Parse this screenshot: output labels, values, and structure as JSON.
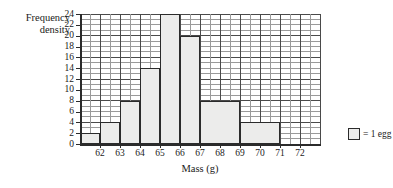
{
  "chart_data": {
    "type": "bar",
    "title": "",
    "xlabel": "Mass (g)",
    "ylabel_lines": [
      "Frequency",
      "density"
    ],
    "ylabel": "Frequency density",
    "xlim": [
      61,
      73
    ],
    "ylim": [
      0,
      24
    ],
    "grid": true,
    "grid_major_x_step": 1,
    "grid_minor_x_step": 0.5,
    "grid_major_y_step": 4,
    "grid_minor_y_step": 1,
    "x_ticks": [
      62,
      63,
      64,
      65,
      66,
      67,
      68,
      69,
      70,
      71,
      72
    ],
    "x_tick_labels": [
      "62",
      "63",
      "64",
      "65",
      "66",
      "67",
      "68",
      "69",
      "70",
      "71",
      "72"
    ],
    "y_ticks": [
      0,
      2,
      4,
      6,
      8,
      10,
      12,
      14,
      16,
      18,
      20,
      22,
      24
    ],
    "y_tick_labels": [
      "0",
      "2",
      "4",
      "6",
      "8",
      "10",
      "12",
      "14",
      "16",
      "18",
      "20",
      "22",
      "24"
    ],
    "bars": [
      {
        "label": "61-62",
        "x0": 61,
        "x1": 62,
        "value": 2
      },
      {
        "label": "62-63",
        "x0": 62,
        "x1": 63,
        "value": 4
      },
      {
        "label": "63-64",
        "x0": 63,
        "x1": 64,
        "value": 8
      },
      {
        "label": "64-65",
        "x0": 64,
        "x1": 65,
        "value": 14
      },
      {
        "label": "65-66",
        "x0": 65,
        "x1": 66,
        "value": 24
      },
      {
        "label": "66-67",
        "x0": 66,
        "x1": 67,
        "value": 20
      },
      {
        "label": "67-69",
        "x0": 67,
        "x1": 69,
        "value": 8
      },
      {
        "label": "69-71",
        "x0": 69,
        "x1": 71,
        "value": 4
      }
    ],
    "bar_fill_color": "#ececeb",
    "bar_edge_color": "#2b2b2b",
    "legend": {
      "position": "right",
      "entries": [
        {
          "swatch": "square",
          "text": "= 1 egg"
        }
      ]
    }
  }
}
